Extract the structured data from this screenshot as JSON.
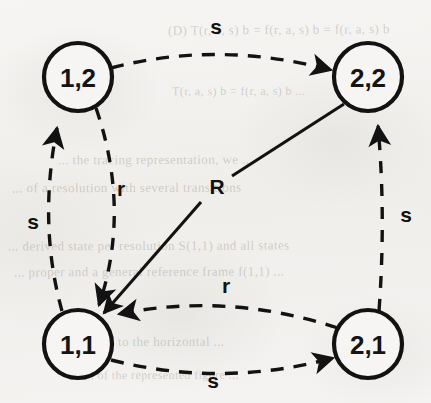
{
  "diagram": {
    "type": "directed-graph",
    "background_color": "#f3f2f0",
    "stroke_color": "#121212",
    "nodes": [
      {
        "id": "n12",
        "label": "1,2",
        "cx": 78,
        "cy": 77,
        "r": 34
      },
      {
        "id": "n22",
        "label": "2,2",
        "cx": 368,
        "cy": 77,
        "r": 34
      },
      {
        "id": "n11",
        "label": "1,1",
        "cx": 78,
        "cy": 344,
        "r": 34
      },
      {
        "id": "n21",
        "label": "2,1",
        "cx": 368,
        "cy": 344,
        "r": 34
      }
    ],
    "edges": [
      {
        "id": "e-12-22",
        "from": "1,2",
        "to": "2,2",
        "label": "s",
        "style": "dashed",
        "label_x": 216,
        "label_y": 34
      },
      {
        "id": "e-11-12",
        "from": "1,1",
        "to": "1,2",
        "label": "s",
        "style": "dashed",
        "label_x": 33,
        "label_y": 229
      },
      {
        "id": "e-12-11",
        "from": "1,2",
        "to": "1,1",
        "label": "r",
        "style": "dashed",
        "label_x": 121,
        "label_y": 196
      },
      {
        "id": "e-21-22",
        "from": "2,1",
        "to": "2,2",
        "label": "s",
        "style": "dashed",
        "label_x": 406,
        "label_y": 222
      },
      {
        "id": "e-21-11",
        "from": "2,1",
        "to": "1,1",
        "label": "r",
        "style": "dashed",
        "label_x": 226,
        "label_y": 293
      },
      {
        "id": "e-11-21",
        "from": "1,1",
        "to": "2,1",
        "label": "s",
        "style": "dashed",
        "label_x": 213,
        "label_y": 388
      },
      {
        "id": "e-22-11",
        "from": "2,2",
        "to": "1,1",
        "label": "R",
        "style": "solid",
        "label_x": 217,
        "label_y": 194
      }
    ],
    "legend": {
      "s": "s",
      "r": "r",
      "R": "R"
    }
  },
  "bleed_through_text": [
    {
      "text": "(D)  T(r, a, s) b  =  f(r, a, s) b  =  f(r, a, s) b",
      "x": 168,
      "y": 22,
      "size": 13,
      "rotate": -0.4
    },
    {
      "text": "T(r, a, s) b  =  f(r, a, s) b ...",
      "x": 172,
      "y": 84,
      "size": 12,
      "rotate": -0.3
    },
    {
      "text": "... the  tracing  representation,  we ...",
      "x": 58,
      "y": 152,
      "size": 13,
      "rotate": -0.2
    },
    {
      "text": "... of  a  resolution  with  several  transitions",
      "x": 12,
      "y": 180,
      "size": 13,
      "rotate": -0.2
    },
    {
      "text": "... derived  state  per  resolution  S(1,1)  and  all  states",
      "x": 8,
      "y": 238,
      "size": 13,
      "rotate": -0.2
    },
    {
      "text": "... proper  and  a  general  reference  frame  f(1,1) ...",
      "x": 14,
      "y": 264,
      "size": 13,
      "rotate": -0.2
    },
    {
      "text": "... ression  to  the  horizontal ...",
      "x": 60,
      "y": 334,
      "size": 13,
      "rotate": -0.2
    },
    {
      "text": "... of  the  represented  figure ...",
      "x": 84,
      "y": 368,
      "size": 12,
      "rotate": -0.2
    }
  ]
}
